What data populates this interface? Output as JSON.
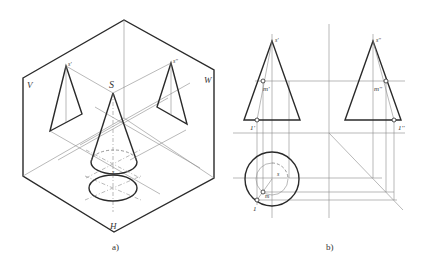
{
  "figure": {
    "panel_a": {
      "caption": "a)",
      "plane_labels": {
        "v": "V",
        "w": "W",
        "h": "H"
      },
      "point_labels": {
        "apex_3d": "S",
        "apex_front": "s'",
        "apex_side": "s''",
        "apex_top": "s"
      }
    },
    "panel_b": {
      "caption": "b)",
      "point_labels": {
        "apex_front": "s'",
        "apex_side": "s''",
        "apex_top": "s",
        "m_front": "m'",
        "m_side": "m''",
        "m_top": "m",
        "one_front": "1'",
        "one_side": "1''",
        "one_top": "1"
      }
    }
  },
  "colors": {
    "line_dark": "#2a2a2a",
    "line_light": "#8a8a8a",
    "background": "#ffffff"
  }
}
